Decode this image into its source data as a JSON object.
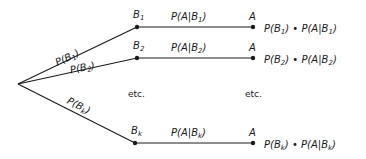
{
  "tree": {
    "branches": [
      {
        "node": "B",
        "sub": "1",
        "edge_label": "P(B1)",
        "cond": "P(A|B1)",
        "leaf": "A",
        "product": "P(B1) • P(A|B1)"
      },
      {
        "node": "B",
        "sub": "2",
        "edge_label": "P(B2)",
        "cond": "P(A|B2)",
        "leaf": "A",
        "product": "P(B2) • P(A|B2)"
      },
      {
        "node": "B",
        "sub": "k",
        "edge_label": "P(Bk)",
        "cond": "P(A|Bk)",
        "leaf": "A",
        "product": "P(Bk) • P(A|Bk)"
      }
    ],
    "ellipsis_left": "etc.",
    "ellipsis_right": "etc."
  },
  "labels": {
    "b1_P": "P(B",
    "b1_sub": "1",
    "close": ")",
    "b2_P": "P(B",
    "b2_sub": "2",
    "bk_P": "P(B",
    "bk_sub": "k",
    "cond1_pre": "P(A|B",
    "cond1_sub": "1",
    "cond2_pre": "P(A|B",
    "cond2_sub": "2",
    "condk_pre": "P(A|B",
    "condk_sub": "k",
    "node_B": "B",
    "leaf_A": "A",
    "prod_pre": "P(B",
    "prod_mid": ") • P(A|B",
    "etc": "etc."
  }
}
